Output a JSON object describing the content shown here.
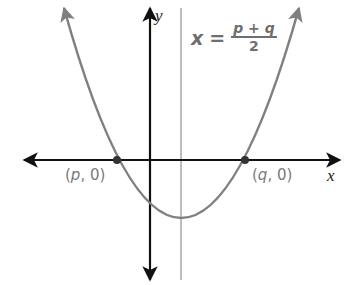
{
  "diagram": {
    "type": "parabola-axis-of-symmetry",
    "colors": {
      "axes": "#111111",
      "parabola": "#808080",
      "symmetry_line": "#a8a8a8",
      "points": "#333333",
      "labels": "#7a7a7a"
    },
    "axes": {
      "x_label": "x",
      "y_label": "y"
    },
    "points": [
      {
        "name": "p-intercept",
        "label_var": "p",
        "label_rest": ", 0)",
        "label_open": "("
      },
      {
        "name": "q-intercept",
        "label_var": "q",
        "label_rest": ", 0)",
        "label_open": "("
      }
    ],
    "equation": {
      "lhs": "x",
      "equals": "=",
      "numerator": "p + q",
      "denominator": "2"
    }
  }
}
